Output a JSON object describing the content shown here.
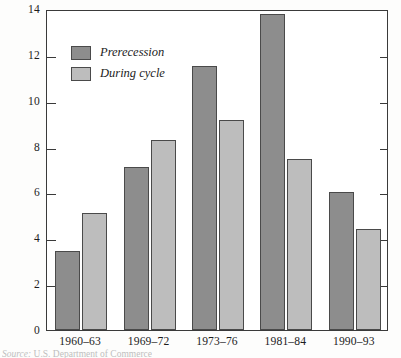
{
  "chart_data": {
    "type": "bar",
    "title": "",
    "subtitle": "",
    "xlabel": "",
    "ylabel": "",
    "categories": [
      "1960–63",
      "1969–72",
      "1973–76",
      "1981–84",
      "1990–93"
    ],
    "series": [
      {
        "name": "Prerecession",
        "color": "#8d8d8d",
        "values": [
          3.45,
          7.1,
          11.5,
          13.8,
          6.0
        ]
      },
      {
        "name": "During cycle",
        "color": "#bdbdbd",
        "values": [
          5.1,
          8.3,
          9.15,
          7.45,
          4.4
        ]
      }
    ],
    "ylim": [
      0,
      14
    ],
    "yticks": [
      0,
      2,
      4,
      6,
      8,
      10,
      12,
      14
    ],
    "ytick_labels": [
      "0",
      "2",
      "4",
      "6",
      "8",
      "10",
      "12",
      "14"
    ],
    "grid": false,
    "legend_position": "upper-left-inside",
    "frame": "box"
  },
  "legend": {
    "items": [
      {
        "label": "Prerecession",
        "swatch": "pre"
      },
      {
        "label": "During cycle",
        "swatch": "cycle"
      }
    ]
  },
  "source_note": {
    "prefix": "Source:",
    "text": "U.S. Department of Commerce"
  },
  "colors": {
    "prerecession": "#8d8d8d",
    "during_cycle": "#bdbdbd",
    "axis": "#3a3a3a",
    "text": "#1c1c1c",
    "background": "#ffffff"
  }
}
